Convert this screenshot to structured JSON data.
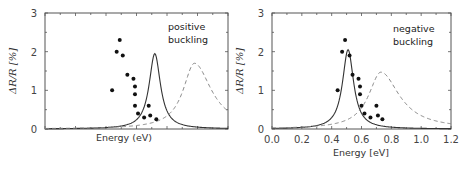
{
  "chart_data": [
    {
      "type": "line",
      "panel": "left",
      "annotation": [
        "positive",
        "buckling"
      ],
      "xlabel": "Energy (eV)",
      "ylabel": "ΔR/R [%]",
      "yticks": [
        "0",
        "1",
        "2",
        "3"
      ],
      "ylim": [
        0,
        3
      ],
      "xticks_labeled": false,
      "xlim": [
        0.0,
        1.2
      ],
      "grid": false,
      "series": [
        {
          "name": "solid",
          "style": "solid",
          "peak_x": 0.72,
          "peak_y": 1.95,
          "width": 0.045,
          "tail": 0.06
        },
        {
          "name": "dashed",
          "style": "dashed",
          "peak_x": 0.98,
          "peak_y": 1.7,
          "width": 0.09,
          "tail": 0.0
        }
      ],
      "points": [
        {
          "x": 0.44,
          "y": 1.0
        },
        {
          "x": 0.47,
          "y": 2.0
        },
        {
          "x": 0.49,
          "y": 2.3
        },
        {
          "x": 0.51,
          "y": 1.9
        },
        {
          "x": 0.54,
          "y": 1.4
        },
        {
          "x": 0.58,
          "y": 1.3
        },
        {
          "x": 0.59,
          "y": 1.1
        },
        {
          "x": 0.59,
          "y": 0.9
        },
        {
          "x": 0.59,
          "y": 0.6
        },
        {
          "x": 0.61,
          "y": 0.4
        },
        {
          "x": 0.65,
          "y": 0.3
        },
        {
          "x": 0.68,
          "y": 0.6
        },
        {
          "x": 0.69,
          "y": 0.35
        },
        {
          "x": 0.73,
          "y": 0.25
        }
      ]
    },
    {
      "type": "line",
      "panel": "right",
      "annotation": [
        "negative",
        "buckling"
      ],
      "xlabel": "Energy [eV]",
      "ylabel": "ΔR/R [%]",
      "yticks": [
        "0",
        "1",
        "2",
        "3"
      ],
      "xticks": [
        "0.0",
        "0.2",
        "0.4",
        "0.6",
        "0.8",
        "1.0",
        "1.2"
      ],
      "ylim": [
        0,
        3
      ],
      "xlim": [
        0.0,
        1.2
      ],
      "grid": false,
      "series": [
        {
          "name": "solid",
          "style": "solid",
          "peak_x": 0.51,
          "peak_y": 2.05,
          "width": 0.045,
          "tail": 0.06
        },
        {
          "name": "dashed",
          "style": "dashed",
          "peak_x": 0.73,
          "peak_y": 1.47,
          "width": 0.1,
          "tail": 0.0
        }
      ],
      "points": [
        {
          "x": 0.44,
          "y": 1.0
        },
        {
          "x": 0.47,
          "y": 2.0
        },
        {
          "x": 0.49,
          "y": 2.3
        },
        {
          "x": 0.52,
          "y": 1.9
        },
        {
          "x": 0.54,
          "y": 1.4
        },
        {
          "x": 0.58,
          "y": 1.3
        },
        {
          "x": 0.59,
          "y": 1.1
        },
        {
          "x": 0.59,
          "y": 0.9
        },
        {
          "x": 0.6,
          "y": 0.6
        },
        {
          "x": 0.62,
          "y": 0.4
        },
        {
          "x": 0.66,
          "y": 0.3
        },
        {
          "x": 0.7,
          "y": 0.6
        },
        {
          "x": 0.71,
          "y": 0.35
        },
        {
          "x": 0.74,
          "y": 0.25
        }
      ]
    }
  ],
  "colors": {
    "frame": "#555555",
    "solid_line": "#333333",
    "dashed_line": "#888888",
    "points": "#111111",
    "ylabel": "#555555"
  }
}
